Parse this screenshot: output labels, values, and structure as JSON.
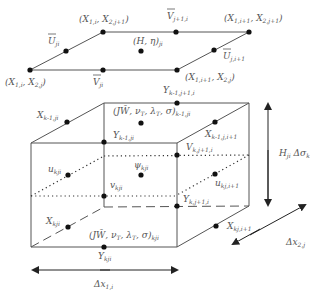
{
  "diagram": {
    "type": "finite-volume grid cell (3D staggered)",
    "top_surface": {
      "corners": [
        {
          "id": "c_i_j",
          "label": "(X_{1,i}, X_{2,j})",
          "main": "(X",
          "s1": "1,i",
          "mid": ", X",
          "s2": "2,j",
          "end": ")"
        },
        {
          "id": "c_i_j1",
          "label": "(X_{1,i}, X_{2,j+1})",
          "main": "(X",
          "s1": "1,i",
          "mid": ", X",
          "s2": "2,j+1",
          "end": ")"
        },
        {
          "id": "c_i1_j1",
          "label": "(X_{1,i+1}, X_{2,j+1})",
          "main": "(X",
          "s1": "1,i+1",
          "mid": ", X",
          "s2": "2,j+1",
          "end": ")"
        },
        {
          "id": "c_i1_j",
          "label": "(X_{1,i+1}, X_{2,j})",
          "main": "(X",
          "s1": "1,i+1",
          "mid": ", X",
          "s2": "2,j",
          "end": ")"
        }
      ],
      "edge_points": [
        {
          "label": "U̅_{ji}",
          "main": "U",
          "sub": "ji"
        },
        {
          "label": "V̅_{ji}",
          "main": "V",
          "sub": "ji"
        },
        {
          "label": "V̅_{j+1,i}",
          "main": "V",
          "sub": "j+1,i"
        },
        {
          "label": "U̅_{j,i+1}",
          "main": "U",
          "sub": "j,i+1"
        }
      ],
      "center": {
        "label": "(H, η)_{ji}",
        "main": "(H, η)",
        "sub": "ji"
      }
    },
    "box": {
      "labels": [
        {
          "id": "x_k1_ji",
          "main": "X",
          "sub": "k-1,ji"
        },
        {
          "id": "y_k1_j1i",
          "main": "Y",
          "sub": "k-1,j+1,i"
        },
        {
          "id": "center_top",
          "main": "(JW̄, ν",
          "s1": "T",
          "mid": ", λ",
          "s2": "T",
          "end": ", σ)",
          "sub": "k-1,ji"
        },
        {
          "id": "y_k1_ji",
          "main": "Y",
          "sub": "k-1,ji"
        },
        {
          "id": "x_k1_jip1",
          "main": "X",
          "sub": "k-1,j,i+1"
        },
        {
          "id": "v_kj1i",
          "main": "V",
          "sub": "k,j+1,i"
        },
        {
          "id": "u_kji",
          "main": "u",
          "sub": "kji"
        },
        {
          "id": "psi_kji",
          "main": "ψ",
          "sub": "kji"
        },
        {
          "id": "v_kji",
          "main": "v",
          "sub": "kji"
        },
        {
          "id": "u_kjip1",
          "main": "u",
          "sub": "kj,i+1"
        },
        {
          "id": "y_kj1i",
          "main": "Y",
          "sub": "k,j+1,i"
        },
        {
          "id": "x_kji",
          "main": "X",
          "sub": "kji"
        },
        {
          "id": "center_bottom",
          "main": "(JW̄, ν",
          "s1": "T",
          "mid": ", λ",
          "s2": "T",
          "end": ", σ)",
          "sub": "kji"
        },
        {
          "id": "x_kjip1",
          "main": "X",
          "sub": "kj,i+1"
        },
        {
          "id": "y_kji",
          "main": "Y",
          "sub": "kji"
        }
      ]
    },
    "dimensions": {
      "vertical": {
        "main": "H",
        "sub1": "ji",
        "mid": " Δσ",
        "sub2": "k"
      },
      "horizontal_x": {
        "main": "Δx",
        "sub": "1,i"
      },
      "horizontal_y": {
        "main": "Δx",
        "sub": "2,j"
      }
    },
    "colors": {
      "line": "#555555",
      "dot": "#111111",
      "text": "#555555"
    }
  }
}
